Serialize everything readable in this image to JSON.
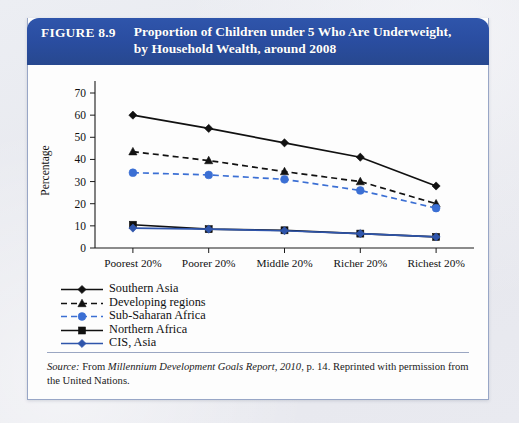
{
  "figure": {
    "label": "FIGURE 8.9",
    "title_line1": "Proportion of Children under 5 Who Are Underweight,",
    "title_line2": "by Household Wealth, around 2008",
    "banner_color": "#2a4da0",
    "border_color": "#98a6c6",
    "page_background": "#e8e9ee"
  },
  "source_note": {
    "label": "Source:",
    "text_before": " From ",
    "italic_title": "Millennium Development Goals Report, 2010",
    "text_after": ", p. 14. Reprinted with permission from the United Nations."
  },
  "chart_data": {
    "type": "line",
    "title": "Proportion of Children under 5 Who Are Underweight, by Household Wealth, around 2008",
    "xlabel": "",
    "ylabel": "Percentage",
    "categories": [
      "Poorest 20%",
      "Poorer 20%",
      "Middle 20%",
      "Richer 20%",
      "Richest 20%"
    ],
    "ylim": [
      0,
      70
    ],
    "yticks": [
      0,
      10,
      20,
      30,
      40,
      50,
      60,
      70
    ],
    "grid": false,
    "legend_position": "below-left",
    "series": [
      {
        "name": "Southern Asia",
        "values": [
          60,
          54,
          47.5,
          41,
          28
        ],
        "color": "#111111",
        "marker": "diamond",
        "dash": "solid"
      },
      {
        "name": "Developing regions",
        "values": [
          43.5,
          39.5,
          34.5,
          30,
          20
        ],
        "color": "#111111",
        "marker": "triangle",
        "dash": "dashed"
      },
      {
        "name": "Sub-Saharan Africa",
        "values": [
          34,
          33,
          31,
          26,
          18
        ],
        "color": "#3b6fd4",
        "marker": "circle",
        "dash": "dashed"
      },
      {
        "name": "Northern Africa",
        "values": [
          10.5,
          8.5,
          8,
          6.5,
          5
        ],
        "color": "#111111",
        "marker": "square",
        "dash": "solid"
      },
      {
        "name": "CIS, Asia",
        "values": [
          9,
          8.5,
          7.8,
          6.5,
          5
        ],
        "color": "#2f55ab",
        "marker": "diamond",
        "dash": "solid"
      }
    ]
  }
}
